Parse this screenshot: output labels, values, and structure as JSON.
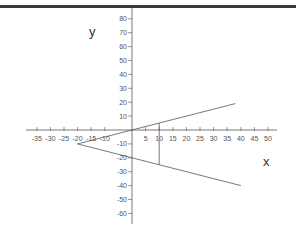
{
  "chart_data": {
    "type": "line",
    "title": "",
    "xlabel": "x",
    "ylabel": "y",
    "xlim": [
      -35,
      50
    ],
    "ylim": [
      -60,
      80
    ],
    "grid": false,
    "x_ticks": [
      -35,
      -30,
      -25,
      -20,
      -15,
      -10,
      5,
      10,
      15,
      20,
      25,
      30,
      35,
      40,
      45,
      50
    ],
    "y_ticks": [
      80,
      70,
      60,
      50,
      40,
      30,
      20,
      10,
      -10,
      -20,
      -30,
      -40,
      -50,
      -60
    ],
    "series": [
      {
        "name": "upper line",
        "equation": "y = 0.5x",
        "points": [
          [
            -20,
            -10
          ],
          [
            38,
            19
          ]
        ]
      },
      {
        "name": "lower line",
        "equation": "y = -0.5x - 20",
        "points": [
          [
            -20,
            -10
          ],
          [
            40,
            -40
          ]
        ]
      },
      {
        "name": "vertical segment",
        "points": [
          [
            10,
            5
          ],
          [
            10,
            -25
          ]
        ]
      }
    ]
  },
  "labels": {
    "x_axis_title": "x",
    "y_axis_title": "y"
  },
  "colors": {
    "axis": "#555555",
    "line": "#555555",
    "top_border": "#3a3a3a"
  }
}
